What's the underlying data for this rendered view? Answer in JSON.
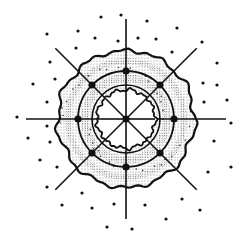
{
  "figure": {
    "type": "radial-ring-diagram",
    "background": "#ffffff",
    "ink": "#111111",
    "stipple": "#8a8a8a",
    "center": [
      126,
      119
    ],
    "rings": {
      "outer_wavy_radius": 68,
      "node_circle_radius": 48,
      "inner_band_radius": 34,
      "inner_wavy_radius": 29
    },
    "radial_line_length": 100,
    "radial_angles_deg": [
      0,
      45,
      90,
      135,
      180,
      225,
      270,
      315
    ],
    "nodes": [
      [
        174,
        119
      ],
      [
        160,
        85
      ],
      [
        126,
        71
      ],
      [
        92,
        85
      ],
      [
        78,
        119
      ],
      [
        92,
        153
      ],
      [
        126,
        167
      ],
      [
        160,
        153
      ],
      [
        126,
        119
      ]
    ],
    "scatter_dots": [
      [
        47,
        34
      ],
      [
        78,
        31
      ],
      [
        101,
        17
      ],
      [
        121,
        15
      ],
      [
        147,
        21
      ],
      [
        177,
        28
      ],
      [
        95,
        38
      ],
      [
        118,
        41
      ],
      [
        138,
        38
      ],
      [
        156,
        39
      ],
      [
        76,
        48
      ],
      [
        172,
        52
      ],
      [
        202,
        42
      ],
      [
        50,
        62
      ],
      [
        33,
        84
      ],
      [
        55,
        79
      ],
      [
        47,
        102
      ],
      [
        17,
        117
      ],
      [
        47,
        126
      ],
      [
        28,
        138
      ],
      [
        50,
        142
      ],
      [
        40,
        160
      ],
      [
        57,
        167
      ],
      [
        217,
        63
      ],
      [
        203,
        83
      ],
      [
        217,
        85
      ],
      [
        227,
        100
      ],
      [
        204,
        102
      ],
      [
        231,
        123
      ],
      [
        214,
        141
      ],
      [
        231,
        167
      ],
      [
        208,
        172
      ],
      [
        47,
        187
      ],
      [
        82,
        193
      ],
      [
        62,
        205
      ],
      [
        92,
        208
      ],
      [
        114,
        204
      ],
      [
        145,
        205
      ],
      [
        182,
        199
      ],
      [
        200,
        210
      ],
      [
        166,
        219
      ],
      [
        107,
        227
      ],
      [
        132,
        229
      ]
    ]
  }
}
